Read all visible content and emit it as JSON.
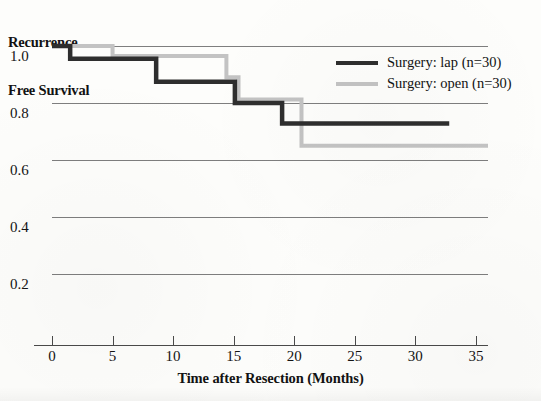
{
  "chart_data": {
    "type": "line",
    "subtype": "kaplan-meier-step",
    "title": "",
    "xlabel": "Time after Resection (Months)",
    "ylabel": "Recurrence Free Survival",
    "ylabel_line1": "Recurrence",
    "ylabel_line2": "Free Survival",
    "xlim": [
      0,
      36
    ],
    "ylim": [
      0.1,
      1.04
    ],
    "xticks": [
      0,
      5,
      10,
      15,
      20,
      25,
      30,
      35
    ],
    "xtick_labels": [
      "0",
      "5",
      "10",
      "15",
      "20",
      "25",
      "30",
      "35"
    ],
    "yticks": [
      1.0,
      0.8,
      0.6,
      0.4,
      0.2
    ],
    "ytick_labels": [
      "1.0",
      "0.8",
      "0.6",
      "0.4",
      "0.2"
    ],
    "grid": true,
    "grid_axis": "y",
    "legend_position": "top-right",
    "series": [
      {
        "name": "Surgery: lap (n=30)",
        "color": "#2e2e2e",
        "linewidth": 4.5,
        "n": 30,
        "steps": [
          {
            "x": 0.0,
            "y": 1.0
          },
          {
            "x": 1.5,
            "y": 1.0
          },
          {
            "x": 1.5,
            "y": 0.955
          },
          {
            "x": 8.6,
            "y": 0.955
          },
          {
            "x": 8.6,
            "y": 0.875
          },
          {
            "x": 15.1,
            "y": 0.875
          },
          {
            "x": 15.1,
            "y": 0.8
          },
          {
            "x": 19.0,
            "y": 0.8
          },
          {
            "x": 19.0,
            "y": 0.728
          },
          {
            "x": 32.8,
            "y": 0.728
          }
        ],
        "final_value": 0.728,
        "last_followup_months": 32.8
      },
      {
        "name": "Surgery: open (n=30)",
        "color": "#c3c3c3",
        "linewidth": 4.0,
        "n": 30,
        "steps": [
          {
            "x": 0.0,
            "y": 1.0
          },
          {
            "x": 5.0,
            "y": 1.0
          },
          {
            "x": 5.0,
            "y": 0.965
          },
          {
            "x": 14.4,
            "y": 0.965
          },
          {
            "x": 14.4,
            "y": 0.89
          },
          {
            "x": 15.4,
            "y": 0.89
          },
          {
            "x": 15.4,
            "y": 0.812
          },
          {
            "x": 20.6,
            "y": 0.812
          },
          {
            "x": 20.6,
            "y": 0.65
          },
          {
            "x": 36.0,
            "y": 0.65
          }
        ],
        "final_value": 0.65,
        "last_followup_months": 36.0
      }
    ]
  },
  "legend": {
    "items": [
      {
        "label": "Surgery: lap (n=30)",
        "color": "#2e2e2e"
      },
      {
        "label": "Surgery: open (n=30)",
        "color": "#c3c3c3"
      }
    ]
  },
  "colors": {
    "lap": "#2e2e2e",
    "open": "#c3c3c3",
    "gridline": "#7e7e7e",
    "axis": "#4a4a4a",
    "text": "#121212",
    "background": "#fdfdfb"
  }
}
